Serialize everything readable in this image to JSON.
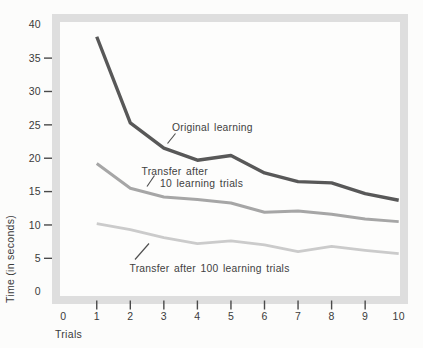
{
  "chart_data": {
    "type": "line",
    "title": "",
    "xlabel": "Trials",
    "ylabel": "Time (in seconds)",
    "xlim": [
      0,
      10
    ],
    "ylim": [
      0,
      40
    ],
    "x_ticks": [
      0,
      1,
      2,
      3,
      4,
      5,
      6,
      7,
      8,
      9,
      10
    ],
    "y_ticks": [
      0,
      5,
      10,
      15,
      20,
      25,
      30,
      35,
      40
    ],
    "grid": false,
    "legend_position": "inline-annotations",
    "x": [
      1,
      2,
      3,
      4,
      5,
      6,
      7,
      8,
      9,
      10
    ],
    "series": [
      {
        "name": "Original learning",
        "color": "#585858",
        "values": [
          38.2,
          25.3,
          21.5,
          19.7,
          20.4,
          17.8,
          16.5,
          16.3,
          14.7,
          13.7
        ]
      },
      {
        "name": "Transfer after 10 learning trials",
        "color": "#a6a6a6",
        "values": [
          19.2,
          15.5,
          14.2,
          13.8,
          13.3,
          11.9,
          12.1,
          11.6,
          10.9,
          10.5
        ]
      },
      {
        "name": "Transfer after 100 learning trials",
        "color": "#cbcbcb",
        "values": [
          10.2,
          9.3,
          8.1,
          7.2,
          7.6,
          7.0,
          6.0,
          6.8,
          6.2,
          5.7
        ]
      }
    ]
  },
  "annotations": {
    "original": "Original learning",
    "transfer10_line1": "Transfer after",
    "transfer10_line2": "10 learning trials",
    "transfer100": "Transfer after 100 learning trials"
  },
  "axes": {
    "xlabel": "Trials",
    "ylabel": "Time (in seconds)"
  },
  "colors": {
    "frame": "#dedede",
    "plot_background": "#fdfdfc",
    "text": "#3a3a3a"
  }
}
